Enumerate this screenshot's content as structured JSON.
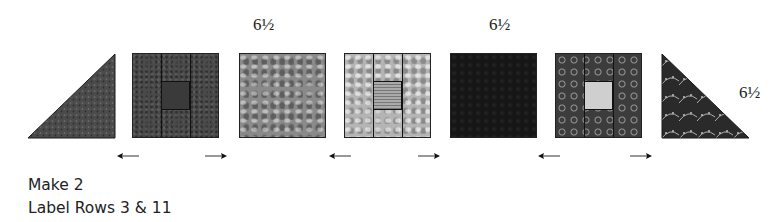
{
  "dimensions": {
    "top_label_1": "6½",
    "top_label_2": "6½",
    "side_label": "6½"
  },
  "units": [
    {
      "id": "triangle-left",
      "shape": "half-square-triangle",
      "fabric": "dark gray print"
    },
    {
      "id": "block-framed-dark",
      "shape": "framed square",
      "fabric": "dark gray print",
      "center": "dark print with motif"
    },
    {
      "id": "square-medium",
      "shape": "square",
      "fabric": "medium gray mottled print"
    },
    {
      "id": "block-framed-light",
      "shape": "framed square",
      "fabric": "light gray mottled print",
      "center": "striped"
    },
    {
      "id": "square-black",
      "shape": "square",
      "fabric": "black tonal print"
    },
    {
      "id": "block-framed-floral",
      "shape": "framed square",
      "fabric": "dark floral print",
      "center": "light vine print"
    },
    {
      "id": "triangle-right",
      "shape": "half-square-triangle",
      "fabric": "dark vine print"
    }
  ],
  "pressing_arrows": [
    {
      "direction": "left"
    },
    {
      "direction": "right"
    },
    {
      "direction": "left"
    },
    {
      "direction": "right"
    },
    {
      "direction": "left"
    },
    {
      "direction": "right"
    }
  ],
  "instructions": {
    "line1": "Make 2",
    "line2": "Label Rows 3 & 11"
  },
  "colors": {
    "background": "#ffffff",
    "outline": "#222222",
    "text": "#222222"
  }
}
